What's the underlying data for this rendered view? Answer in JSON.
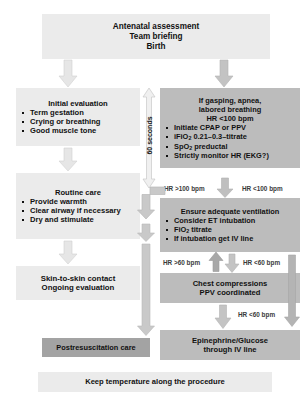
{
  "diagram": {
    "colors": {
      "light_box": "#ebebeb",
      "medium_box": "#bcbcbc",
      "dark_box": "#a3a3a3",
      "arrow_light": "#e2e2e2",
      "arrow_medium": "#b6b6b6",
      "arrow_dark": "#9a9a9a",
      "text": "#111111",
      "label_text": "#3a3a3a"
    }
  },
  "top_box": {
    "line1": "Antenatal assessment",
    "line2": "Team briefing",
    "line3": "Birth"
  },
  "left_column": {
    "initial_evaluation": {
      "title": "Initial evaluation",
      "items": [
        "Term gestation",
        "Crying or breathing",
        "Good muscle tone"
      ]
    },
    "routine_care": {
      "title": "Routine care",
      "items": [
        "Provide warmth",
        "Clear airway if necessary",
        "Dry and stimulate"
      ]
    },
    "skin_to_skin": {
      "line1": "Skin-to-skin contact",
      "line2": "Ongoing evaluation"
    },
    "postresuscitation": {
      "label": "Postresuscitation care"
    }
  },
  "right_column": {
    "distress": {
      "line1": "If gasping, apnea,",
      "line2": "labored breathing",
      "line3_prefix": "HR <100 bpm",
      "items": [
        "Initiate CPAP or PPV",
        "iFiO2 0.21–0.3–titrate",
        "SpO2 preductal",
        "Strictly monitor HR (EKG?)"
      ],
      "item_ifio2_main": "iFiO",
      "item_ifio2_sub": "2",
      "item_ifio2_rest": " 0.21–0.3–titrate",
      "item_spo2_main": "SpO",
      "item_spo2_sub": "2",
      "item_spo2_rest": " preductal",
      "item_cpap": "Initiate CPAP or PPV",
      "item_monitor": "Strictly monitor HR (EKG?)"
    },
    "ventilation": {
      "title": "Ensure adequate ventilation",
      "item_et": "Consider ET intubation",
      "item_fio2_main": "FiO",
      "item_fio2_sub": "2",
      "item_fio2_rest": " titrate",
      "item_iv": "If intubation get IV line",
      "items": [
        "Consider ET intubation",
        "FiO2 titrate",
        "If intubation get IV line"
      ]
    },
    "chest_compressions": {
      "line1": "Chest compressions",
      "line2": "PPV coordinated"
    },
    "epinephrine": {
      "line1": "Epinephrine/Glucose",
      "line2": "through IV line"
    }
  },
  "labels": {
    "sixty_seconds": "60 seconds",
    "hr_gt_100": "HR >100 bpm",
    "hr_lt_100": "HR <100 bpm",
    "hr_gt_60": "HR >60 bpm",
    "hr_lt_60_a": "HR <60 bpm",
    "hr_lt_60_b": "HR <60 bpm"
  },
  "bottom_bar": {
    "label": "Keep temperature along the procedure"
  }
}
